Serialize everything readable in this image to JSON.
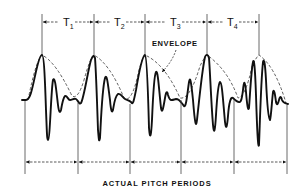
{
  "figure": {
    "width": 302,
    "height": 193,
    "colors": {
      "background": "#ffffff",
      "ink": "#111111",
      "envelope": "#333333",
      "guide": "#444444"
    },
    "envelope_label": {
      "text": "ENVELOPE",
      "x": 152,
      "y": 46,
      "arrow_path": "M 176 50 Q 172 62 162 72"
    },
    "caption": {
      "text": "ACTUAL PITCH PERIODS",
      "x": 157,
      "y": 186
    },
    "top_markers": {
      "y_top": 14,
      "arrow_y": 22,
      "lines": [
        {
          "x": 42,
          "y_bottom": 55
        },
        {
          "x": 94,
          "y_bottom": 55
        },
        {
          "x": 145,
          "y_bottom": 55
        },
        {
          "x": 207,
          "y_bottom": 55
        },
        {
          "x": 259,
          "y_bottom": 55
        }
      ],
      "periods": [
        {
          "label": "T",
          "sub": "1",
          "x": 66
        },
        {
          "label": "T",
          "sub": "2",
          "x": 117
        },
        {
          "label": "T",
          "sub": "3",
          "x": 173
        },
        {
          "label": "T",
          "sub": "4",
          "x": 230
        }
      ]
    },
    "bottom_markers": {
      "y_bottom": 174,
      "arrow_y": 162,
      "lines": [
        {
          "x": 25,
          "y_top": 101
        },
        {
          "x": 78,
          "y_top": 103
        },
        {
          "x": 130,
          "y_top": 104
        },
        {
          "x": 181,
          "y_top": 100
        },
        {
          "x": 234,
          "y_top": 100
        },
        {
          "x": 287,
          "y_top": 105
        }
      ]
    },
    "envelope_path": "M 28 100 Q 36 60 42 55 Q 56 62 72 96 Q 78 100 84 80 Q 90 58 94 55 Q 110 64 124 98 Q 132 104 139 70 Q 143 56 145 55 Q 165 64 180 98 Q 190 100 200 66 Q 205 56 207 55 Q 228 70 238 98 Q 246 96 252 66 Q 257 56 259 55 Q 275 66 286 103",
    "waveform_path": "M 22 100 L 26 100 C 30 100 32 90 35 76 C 38 62 40 55 42 55 C 44 55 45 80 46 110 C 47 135 47 140 48 140 C 50 140 51 90 53 80 C 55 76 56 88 58 105 C 59 113 60 113 61 110 C 62 104 63 98 65 96 C 67 95 68 100 70 100 C 72 100 74 98 76 99 C 78 100 79 105 81 103 C 84 98 88 70 91 60 C 93 55 94 55 95 58 C 96 70 97 100 98 130 C 99 142 99 142 100 138 C 101 120 102 90 105 78 C 107 73 108 85 110 100 C 111 112 112 113 113 110 C 114 104 115 96 118 94 C 121 93 123 98 125 99 C 127 100 129 100 131 102 C 133 106 134 100 136 90 C 139 72 142 56 145 55 C 147 56 148 90 149 128 C 150 140 151 138 152 120 C 153 96 154 75 156 72 C 158 70 159 90 161 108 C 162 114 163 110 165 98 C 166 92 167 90 168 95 C 170 102 172 100 176 99 C 180 99 182 104 184 106 C 186 108 187 96 189 82 C 190 76 191 80 193 100 C 195 125 196 128 197 120 C 199 102 202 70 205 57 C 206 54 208 54 209 58 C 210 70 211 100 213 125 C 214 135 215 132 216 115 C 217 98 218 84 220 82 C 222 82 223 100 225 122 C 226 130 227 128 228 116 C 229 102 231 96 233 98 C 235 100 237 102 239 102 C 241 103 242 98 243 90 C 244 80 245 80 246 92 C 247 104 248 112 249 108 C 250 96 251 72 253 62 C 254 58 255 66 256 95 C 257 128 258 150 259 145 C 260 120 261 80 263 62 C 264 58 265 62 266 80 C 267 102 268 118 270 120 C 271 118 272 100 273 92 C 274 88 275 94 276 102 C 277 106 278 104 279 100 C 280 96 281 96 282 100 C 283 103 285 103 288 104"
  }
}
